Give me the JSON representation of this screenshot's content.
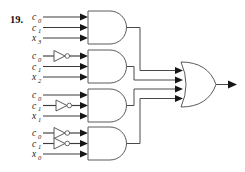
{
  "figure": {
    "exercise_number": "19.",
    "kind": "logic-circuit-diagram",
    "background_color": "#ffffff",
    "wire_color": "#4a4a4a",
    "gate_outline_color": "#5a5a5a",
    "marker_color": "#161616"
  },
  "gates": {
    "and_gates": [
      {
        "id": "and-gate-1",
        "name": "and-gate-1",
        "inputs": [
          {
            "label": "c",
            "sub": "0",
            "inverted": false
          },
          {
            "label": "c",
            "sub": "1",
            "inverted": false
          },
          {
            "label": "x",
            "sub": "3",
            "inverted": false
          }
        ]
      },
      {
        "id": "and-gate-2",
        "name": "and-gate-2",
        "inputs": [
          {
            "label": "c",
            "sub": "0",
            "inverted": true
          },
          {
            "label": "c",
            "sub": "1",
            "inverted": false
          },
          {
            "label": "x",
            "sub": "2",
            "inverted": false
          }
        ]
      },
      {
        "id": "and-gate-3",
        "name": "and-gate-3",
        "inputs": [
          {
            "label": "c",
            "sub": "0",
            "inverted": false
          },
          {
            "label": "c",
            "sub": "1",
            "inverted": true
          },
          {
            "label": "x",
            "sub": "1",
            "inverted": false
          }
        ]
      },
      {
        "id": "and-gate-4",
        "name": "and-gate-4",
        "inputs": [
          {
            "label": "c",
            "sub": "0",
            "inverted": true
          },
          {
            "label": "c",
            "sub": "1",
            "inverted": true
          },
          {
            "label": "x",
            "sub": "0",
            "inverted": false
          }
        ]
      }
    ],
    "or_gate": {
      "id": "or-gate",
      "name": "or-gate-output",
      "input_count": 4
    },
    "not_gate_count": 4
  },
  "labels": {
    "g1": [
      "c0",
      "c1",
      "x3"
    ],
    "g2": [
      "c0",
      "c1",
      "x2"
    ],
    "g3": [
      "c0",
      "c1",
      "x1"
    ],
    "g4": [
      "c0",
      "c1",
      "x0"
    ]
  }
}
